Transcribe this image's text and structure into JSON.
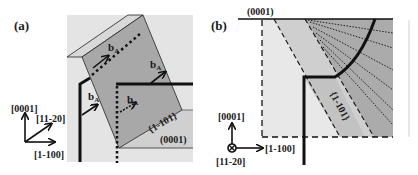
{
  "figure": {
    "panel_a": {
      "label": "(a)",
      "plane_label_tilted": "{1-101}",
      "plane_label_basal": "(0001)",
      "burgers_vector": "b",
      "burgers_subscript": "A",
      "axes": {
        "up": "[0001]",
        "diag": "[11-20]",
        "right": "[1-100]"
      }
    },
    "panel_b": {
      "label": "(b)",
      "plane_label_top": "(0001)",
      "plane_label_tilted": "{1-101}",
      "axes": {
        "up": "[0001]",
        "into_page": "[11-20]",
        "right": "[1-100]"
      }
    },
    "colors": {
      "background_light": "#e6e6e6",
      "region_mid": "#c8c8c8",
      "region_dark": "#a9a9a9",
      "slab_top": "#d4d4d4",
      "line": "#111111",
      "text": "#1a1a1a"
    }
  }
}
